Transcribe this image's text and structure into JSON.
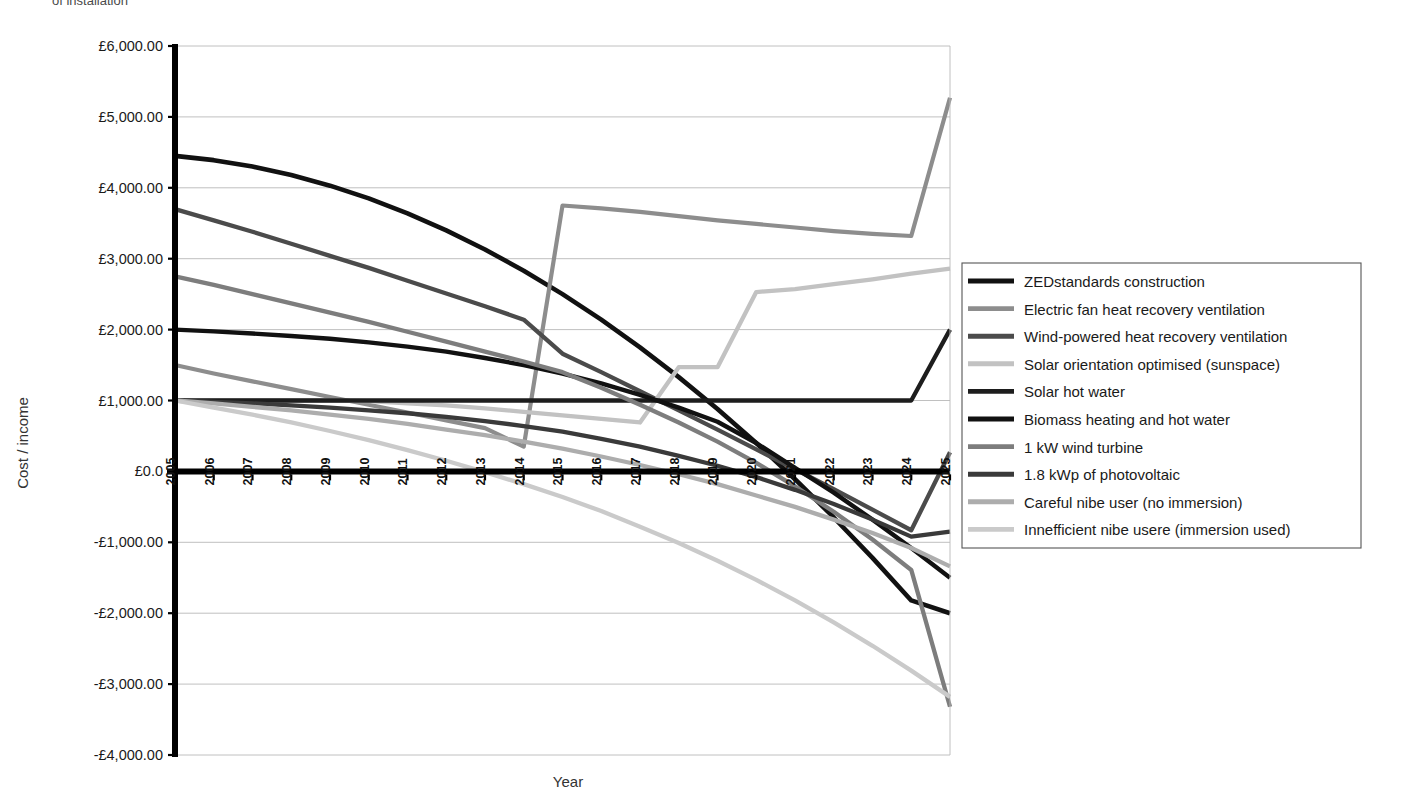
{
  "clipped_title": "of installation",
  "chart_data": {
    "type": "line",
    "title": "",
    "xlabel": "Year",
    "ylabel": "Cost / income",
    "currency_prefix": "£",
    "grid": true,
    "legend_position": "right",
    "xlim": [
      2005,
      2025
    ],
    "ylim": [
      -4000,
      6000
    ],
    "ytick_step": 1000,
    "ytick_labels": [
      "£6,000.00",
      "£5,000.00",
      "£4,000.00",
      "£3,000.00",
      "£2,000.00",
      "£1,000.00",
      "£0.0",
      "-£1,000.00",
      "-£2,000.00",
      "-£3,000.00",
      "-£4,000.00"
    ],
    "ytick_values": [
      6000,
      5000,
      4000,
      3000,
      2000,
      1000,
      0,
      -1000,
      -2000,
      -3000,
      -4000
    ],
    "categories": [
      "2005",
      "2006",
      "2007",
      "2008",
      "2009",
      "2010",
      "2011",
      "2012",
      "2013",
      "2014",
      "2015",
      "2016",
      "2017",
      "2018",
      "2019",
      "2020",
      "2021",
      "2022",
      "2023",
      "2024",
      "2025"
    ],
    "x": [
      2005,
      2006,
      2007,
      2008,
      2009,
      2010,
      2011,
      2012,
      2013,
      2014,
      2015,
      2016,
      2017,
      2018,
      2019,
      2020,
      2021,
      2022,
      2023,
      2024,
      2025
    ],
    "series": [
      {
        "name": "ZEDstandards construction",
        "color": "#111111",
        "width": 4.6,
        "values": [
          4450,
          4390,
          4300,
          4180,
          4030,
          3850,
          3640,
          3400,
          3130,
          2830,
          2500,
          2140,
          1750,
          1330,
          880,
          400,
          -110,
          -650,
          -1220,
          -1820,
          -2000
        ]
      },
      {
        "name": "Electric fan heat recovery ventilation",
        "color": "#8d8d8d",
        "width": 4.2,
        "values": [
          1500,
          1380,
          1270,
          1160,
          1050,
          940,
          830,
          720,
          610,
          350,
          3750,
          3710,
          3660,
          3600,
          3540,
          3490,
          3440,
          3390,
          3350,
          3320,
          5270
        ]
      },
      {
        "name": "Wind-powered heat recovery ventilation",
        "color": "#4b4b4b",
        "width": 4.3,
        "values": [
          3700,
          3540,
          3380,
          3210,
          3040,
          2870,
          2690,
          2510,
          2330,
          2140,
          1660,
          1400,
          1130,
          860,
          590,
          310,
          30,
          -250,
          -540,
          -830,
          270
        ]
      },
      {
        "name": "Solar orientation optimised (sunspace)",
        "color": "#c2c2c2",
        "width": 4.3,
        "values": [
          1000,
          1000,
          1000,
          1000,
          1000,
          990,
          960,
          930,
          890,
          840,
          790,
          740,
          690,
          1470,
          1470,
          2530,
          2570,
          2640,
          2710,
          2790,
          2860
        ]
      },
      {
        "name": "Solar hot water",
        "color": "#1d1d1d",
        "width": 4.3,
        "values": [
          1000,
          1000,
          1000,
          1000,
          1000,
          1000,
          1000,
          1000,
          1000,
          1000,
          1000,
          1000,
          1000,
          1000,
          1000,
          1000,
          1000,
          1000,
          1000,
          1000,
          2000
        ]
      },
      {
        "name": "Biomass heating and hot water",
        "color": "#111111",
        "width": 4.4,
        "values": [
          2000,
          1975,
          1945,
          1910,
          1870,
          1820,
          1760,
          1690,
          1600,
          1500,
          1380,
          1240,
          1080,
          900,
          700,
          400,
          50,
          -300,
          -680,
          -1080,
          -1500
        ]
      },
      {
        "name": "1 kW wind turbine",
        "color": "#7d7d7d",
        "width": 4.3,
        "values": [
          2750,
          2630,
          2500,
          2370,
          2240,
          2110,
          1970,
          1830,
          1690,
          1550,
          1400,
          1180,
          940,
          690,
          420,
          120,
          -210,
          -570,
          -960,
          -1390,
          -3320
        ]
      },
      {
        "name": "1.8 kWp of photovoltaic",
        "color": "#3a3a3a",
        "width": 4.3,
        "values": [
          1000,
          980,
          960,
          930,
          900,
          860,
          820,
          770,
          710,
          640,
          560,
          460,
          350,
          220,
          80,
          -80,
          -260,
          -460,
          -680,
          -920,
          -850
        ]
      },
      {
        "name": "Careful nibe user (no immersion)",
        "color": "#adadad",
        "width": 4.3,
        "values": [
          1000,
          960,
          910,
          860,
          800,
          740,
          670,
          590,
          510,
          420,
          320,
          210,
          90,
          -40,
          -180,
          -340,
          -500,
          -680,
          -870,
          -1080,
          -1340
        ]
      },
      {
        "name": "Innefficient nibe usere (immersion used)",
        "color": "#cacaca",
        "width": 4.3,
        "values": [
          1000,
          900,
          800,
          690,
          570,
          440,
          300,
          150,
          -10,
          -180,
          -360,
          -560,
          -780,
          -1010,
          -1260,
          -1530,
          -1820,
          -2130,
          -2460,
          -2810,
          -3180
        ]
      }
    ]
  },
  "legend": {
    "items": [
      "ZEDstandards construction",
      "Electric fan heat recovery ventilation",
      "Wind-powered heat recovery ventilation",
      "Solar orientation optimised (sunspace)",
      "Solar hot water",
      "Biomass heating and hot water",
      "1 kW wind turbine",
      "1.8 kWp of photovoltaic",
      "Careful nibe user (no immersion)",
      "Innefficient nibe usere (immersion used)"
    ]
  }
}
